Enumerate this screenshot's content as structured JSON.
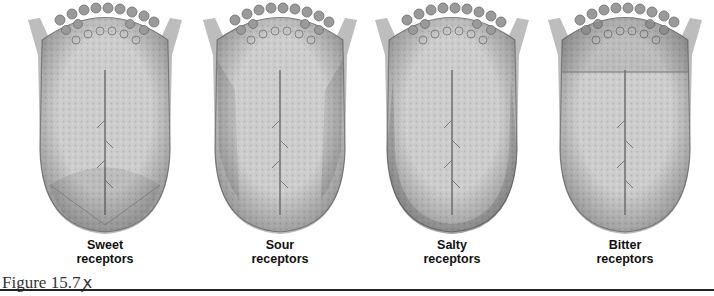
{
  "figure": {
    "caption": "Figure 15.7",
    "caption_mark": "ꭗ",
    "panels": [
      {
        "id": "sweet",
        "label_line1": "Sweet",
        "label_line2": "receptors",
        "highlight": "tip"
      },
      {
        "id": "sour",
        "label_line1": "Sour",
        "label_line2": "receptors",
        "highlight": "sides"
      },
      {
        "id": "salty",
        "label_line1": "Salty",
        "label_line2": "receptors",
        "highlight": "edges"
      },
      {
        "id": "bitter",
        "label_line1": "Bitter",
        "label_line2": "receptors",
        "highlight": "back"
      }
    ]
  },
  "colors": {
    "tongue_fill": "#cfcfcf",
    "tongue_shade": "#a8a8a8",
    "papillae": "#8c8c8c",
    "line": "#555555"
  }
}
